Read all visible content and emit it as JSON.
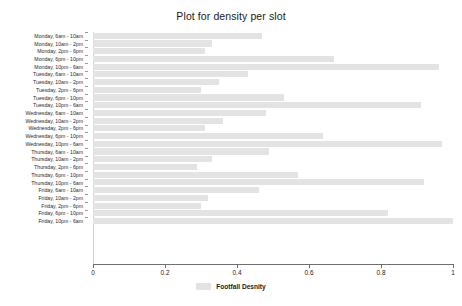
{
  "chart_data": {
    "type": "bar",
    "orientation": "horizontal",
    "title": "Plot for density per slot",
    "xlabel": "",
    "ylabel": "",
    "xlim": [
      0,
      1
    ],
    "ylim": null,
    "grid": false,
    "legend": {
      "position": "bottom",
      "entries": [
        {
          "name": "Footfall Desnity",
          "color": "#e3e3e3"
        }
      ]
    },
    "xticks": [
      0,
      0.2,
      0.4,
      0.6,
      0.8,
      1
    ],
    "xtick_labels": [
      "0",
      "0.2",
      "0.4",
      "0.6",
      "0.8",
      "1"
    ],
    "categories": [
      "Monday, 6am - 10am",
      "Monday, 10am - 2pm",
      "Monday, 2pm - 6pm",
      "Monday, 6pm - 10pm",
      "Monday, 10pm - 6am",
      "Tuesday, 6am - 10am",
      "Tuesday, 10am - 2pm",
      "Tuesday, 2pm - 6pm",
      "Tuesday, 6pm - 10pm",
      "Tuesday, 10pm - 6am",
      "Wednesday, 6am - 10am",
      "Wednesday, 10am - 2pm",
      "Wednesday, 2pm - 6pm",
      "Wednesday, 6pm - 10pm",
      "Wednesday, 10pm - 6am",
      "Thursday, 6am - 10am",
      "Thursday, 10am - 2pm",
      "Thursday, 2pm - 6pm",
      "Thursday, 6pm - 10pm",
      "Thursday, 10pm - 6am",
      "Friday, 6am - 10am",
      "Friday, 10am - 2pm",
      "Friday, 2pm - 6pm",
      "Friday, 6pm - 10pm",
      "Friday, 10pm - 6am"
    ],
    "series": [
      {
        "name": "Footfall Desnity",
        "color": "#e3e3e3",
        "values": [
          0.47,
          0.33,
          0.31,
          0.67,
          0.96,
          0.43,
          0.35,
          0.3,
          0.53,
          0.91,
          0.48,
          0.36,
          0.31,
          0.64,
          0.97,
          0.49,
          0.33,
          0.29,
          0.57,
          0.92,
          0.46,
          0.32,
          0.3,
          0.82,
          1.0
        ]
      }
    ]
  }
}
